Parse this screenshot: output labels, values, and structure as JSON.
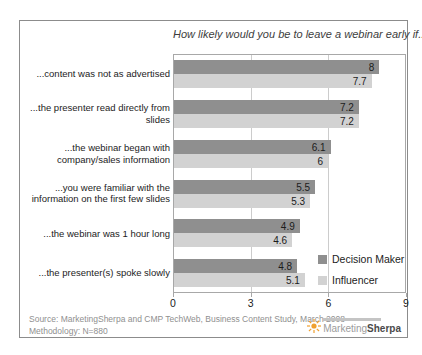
{
  "chart_data": {
    "type": "bar",
    "orientation": "horizontal",
    "title": "How likely would you be to leave a webinar early if...",
    "categories": [
      "...content was not as advertised",
      "...the presenter read directly from slides",
      "...the webinar began with company/sales information",
      "...you were familiar with the information on the first few slides",
      "...the webinar was 1 hour long",
      "...the presenter(s) spoke slowly"
    ],
    "series": [
      {
        "name": "Decision Maker",
        "color": "#8f8f8f",
        "values": [
          8,
          7.2,
          6.1,
          5.5,
          4.9,
          4.8
        ]
      },
      {
        "name": "Influencer",
        "color": "#d2d2d2",
        "values": [
          7.7,
          7.2,
          6,
          5.3,
          4.6,
          5.1
        ]
      }
    ],
    "xlim": [
      0,
      9
    ],
    "x_ticks": [
      0,
      3,
      6,
      9
    ],
    "grid": "vertical-at-3-and-6",
    "legend_position": "inside-bottom-right"
  },
  "footer": {
    "source_line": "Source: MarketingSherpa and CMP TechWeb, Business Content Study, March 2008",
    "methodology_line": "Methodology: N=880"
  },
  "logo": {
    "name": "MarketingSherpa",
    "text_light": "Marketing",
    "text_bold": "Sherpa",
    "sun_color": "#f0a030"
  }
}
